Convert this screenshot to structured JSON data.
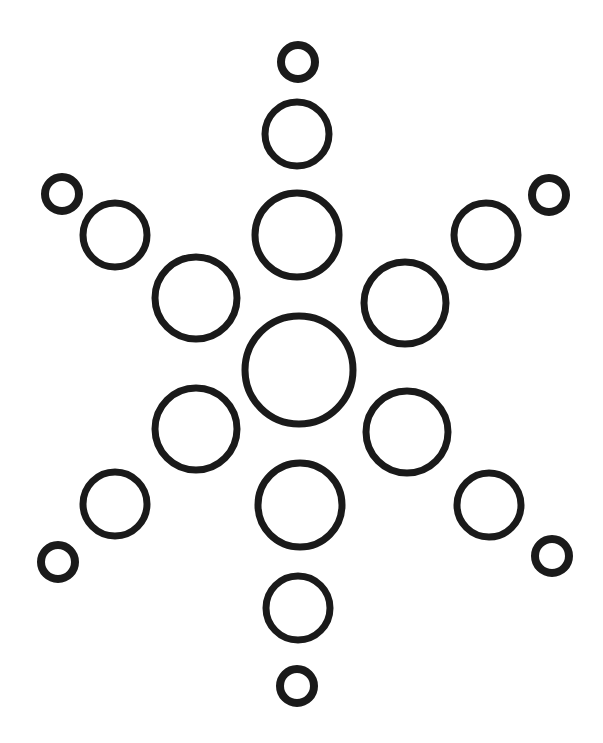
{
  "figure": {
    "stroke_color": "#1a1a1a",
    "background": "#ffffff",
    "circles": [
      {
        "id": "center",
        "cx": 299,
        "cy": 370,
        "r": 54,
        "sw": 7
      },
      {
        "id": "arm-top-1",
        "cx": 297,
        "cy": 235,
        "r": 42,
        "sw": 7
      },
      {
        "id": "arm-top-2",
        "cx": 297,
        "cy": 134,
        "r": 32,
        "sw": 7
      },
      {
        "id": "arm-top-3",
        "cx": 298,
        "cy": 62,
        "r": 17,
        "sw": 8
      },
      {
        "id": "arm-bottom-1",
        "cx": 300,
        "cy": 505,
        "r": 42,
        "sw": 7
      },
      {
        "id": "arm-bottom-2",
        "cx": 298,
        "cy": 608,
        "r": 32,
        "sw": 7
      },
      {
        "id": "arm-bottom-3",
        "cx": 297,
        "cy": 686,
        "r": 17,
        "sw": 8
      },
      {
        "id": "arm-upper-left-1",
        "cx": 196,
        "cy": 298,
        "r": 41,
        "sw": 7
      },
      {
        "id": "arm-upper-left-2",
        "cx": 115,
        "cy": 235,
        "r": 32,
        "sw": 7
      },
      {
        "id": "arm-upper-left-3",
        "cx": 62,
        "cy": 194,
        "r": 17,
        "sw": 8
      },
      {
        "id": "arm-upper-right-1",
        "cx": 405,
        "cy": 303,
        "r": 41,
        "sw": 7
      },
      {
        "id": "arm-upper-right-2",
        "cx": 486,
        "cy": 235,
        "r": 32,
        "sw": 7
      },
      {
        "id": "arm-upper-right-3",
        "cx": 549,
        "cy": 195,
        "r": 17,
        "sw": 8
      },
      {
        "id": "arm-lower-left-1",
        "cx": 196,
        "cy": 429,
        "r": 41,
        "sw": 7
      },
      {
        "id": "arm-lower-left-2",
        "cx": 115,
        "cy": 504,
        "r": 32,
        "sw": 7
      },
      {
        "id": "arm-lower-left-3",
        "cx": 58,
        "cy": 562,
        "r": 17,
        "sw": 8
      },
      {
        "id": "arm-lower-right-1",
        "cx": 407,
        "cy": 432,
        "r": 41,
        "sw": 7
      },
      {
        "id": "arm-lower-right-2",
        "cx": 489,
        "cy": 505,
        "r": 32,
        "sw": 7
      },
      {
        "id": "arm-lower-right-3",
        "cx": 552,
        "cy": 556,
        "r": 17,
        "sw": 8
      }
    ]
  }
}
